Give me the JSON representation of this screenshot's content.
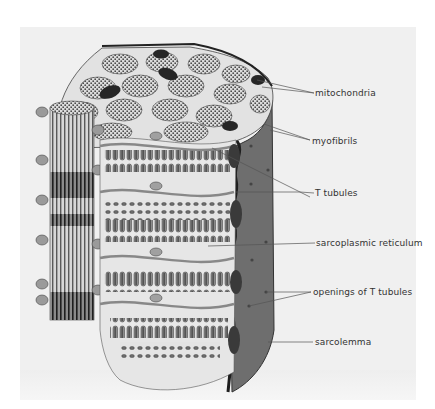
{
  "figure": {
    "colors": {
      "panel_background": "#f0f0f0",
      "sarcolemma_fill": "#6e6e6e",
      "sarcolemma_dark": "#3a3a3a",
      "cytoplasm": "#e6e6e6",
      "reticulum_tone": "#9a9a9a",
      "mitochondria": "#2a2a2a",
      "leader_line": "#555555",
      "label_text": "#333333"
    }
  },
  "labels": [
    {
      "id": "mitochondria",
      "text": "mitochondria"
    },
    {
      "id": "myofibrils",
      "text": "myofibrils"
    },
    {
      "id": "t-tubules",
      "text": "T tubules"
    },
    {
      "id": "sarcoplasmic-reticulum",
      "text": "sarcoplasmic reticulum"
    },
    {
      "id": "openings-of-t-tubules",
      "text": "openings of T tubules"
    },
    {
      "id": "sarcolemma",
      "text": "sarcolemma"
    }
  ]
}
